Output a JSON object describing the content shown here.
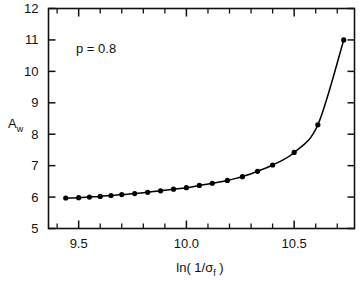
{
  "chart_data": {
    "type": "line",
    "title": "",
    "subtitle": "",
    "xlabel": "ln( 1/σ",
    "xlabel_sub": "f",
    "xlabel_close": " )",
    "ylabel": "A",
    "ylabel_sub": "w",
    "annotation": "p = 0.8",
    "xlim": [
      9.36,
      10.78
    ],
    "ylim": [
      5,
      12
    ],
    "grid": false,
    "legend": "none",
    "x_major_ticks": [
      9.5,
      10.0,
      10.5
    ],
    "x_major_tick_labels": [
      "9.5",
      "10.0",
      "10.5"
    ],
    "x_minor_ticks": [
      9.4,
      9.6,
      9.7,
      9.8,
      9.9,
      10.1,
      10.2,
      10.3,
      10.4,
      10.6,
      10.7
    ],
    "y_major_ticks": [
      5,
      6,
      7,
      8,
      9,
      10,
      11,
      12
    ],
    "y_major_tick_labels": [
      "5",
      "6",
      "7",
      "8",
      "9",
      "10",
      "11",
      "12"
    ],
    "marker": "filled-circle",
    "marker_color": "#000000",
    "line_color": "#000000",
    "series": [
      {
        "name": "A_w vs ln(1/sigma_f)",
        "x": [
          9.44,
          9.5,
          9.55,
          9.6,
          9.65,
          9.7,
          9.76,
          9.82,
          9.88,
          9.94,
          10.0,
          10.06,
          10.12,
          10.19,
          10.26,
          10.33,
          10.4,
          10.5,
          10.61,
          10.73
        ],
        "y": [
          5.97,
          5.98,
          6.0,
          6.02,
          6.05,
          6.08,
          6.11,
          6.15,
          6.2,
          6.25,
          6.3,
          6.37,
          6.44,
          6.53,
          6.65,
          6.82,
          7.02,
          7.42,
          8.3,
          11.0
        ]
      }
    ]
  }
}
